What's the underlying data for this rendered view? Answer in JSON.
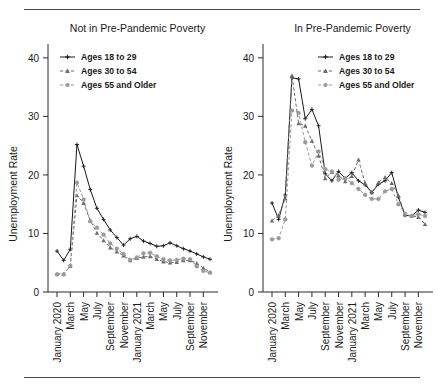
{
  "figure": {
    "top_rule": true,
    "bottom_rule": true,
    "rule_color": "#4a4a4a",
    "background": "#ffffff"
  },
  "axis": {
    "ylabel": "Unemployment Rate",
    "yticks": [
      0,
      10,
      20,
      30,
      40
    ],
    "ylim": [
      0,
      41
    ],
    "xtick_labels": [
      "January 2020",
      "March",
      "May",
      "July",
      "September",
      "November",
      "January 2021",
      "March",
      "May",
      "July",
      "September",
      "November"
    ],
    "xtick_indices": [
      0,
      2,
      4,
      6,
      8,
      10,
      12,
      14,
      16,
      18,
      20,
      22
    ]
  },
  "legend": {
    "entries": [
      {
        "label": "Ages 18 to 29",
        "color": "#1a1a1a",
        "marker": "cross",
        "dash": "solid"
      },
      {
        "label": "Ages 30 to 54",
        "color": "#6b6b6b",
        "marker": "triangle",
        "dash": "dashed"
      },
      {
        "label": "Ages 55 and Older",
        "color": "#9a9a9a",
        "marker": "circle",
        "dash": "dashed"
      }
    ]
  },
  "chart_data": [
    {
      "type": "line",
      "panel": "left",
      "title": "Not in Pre-Pandemic Poverty",
      "xlabel": "",
      "ylabel": "Unemployment Rate",
      "ylim": [
        0,
        41
      ],
      "grid": false,
      "legend_position": "top-left",
      "categories": [
        "January 2020",
        "February 2020",
        "March 2020",
        "April 2020",
        "May 2020",
        "June 2020",
        "July 2020",
        "August 2020",
        "September 2020",
        "October 2020",
        "November 2020",
        "December 2020",
        "January 2021",
        "February 2021",
        "March 2021",
        "April 2021",
        "May 2021",
        "June 2021",
        "July 2021",
        "August 2021",
        "September 2021",
        "October 2021",
        "November 2021",
        "December 2021"
      ],
      "series": [
        {
          "name": "Ages 18 to 29",
          "color": "#1a1a1a",
          "marker": "cross",
          "dash": "solid",
          "values": [
            7.0,
            5.4,
            7.3,
            25.2,
            21.5,
            17.5,
            14.3,
            12.4,
            10.6,
            9.3,
            8.0,
            9.1,
            9.5,
            8.7,
            8.3,
            7.8,
            7.9,
            8.4,
            7.9,
            7.4,
            7.0,
            6.5,
            6.0,
            5.6
          ],
          "linewidth": 1.0
        },
        {
          "name": "Ages 30 to 54",
          "color": "#6b6b6b",
          "marker": "triangle",
          "dash": "dashed",
          "values": [
            3.1,
            3.1,
            4.4,
            16.5,
            15.2,
            12.2,
            10.1,
            8.8,
            7.6,
            6.9,
            6.2,
            5.4,
            5.8,
            6.0,
            6.1,
            5.6,
            5.2,
            5.0,
            5.1,
            5.4,
            5.4,
            4.9,
            4.1,
            3.4
          ],
          "linewidth": 1.0
        },
        {
          "name": "Ages 55 and Older",
          "color": "#9a9a9a",
          "marker": "circle",
          "dash": "dashed",
          "values": [
            3.0,
            3.0,
            4.5,
            18.7,
            15.8,
            12.1,
            11.0,
            9.8,
            8.3,
            7.4,
            6.5,
            5.5,
            5.9,
            6.6,
            6.7,
            6.1,
            5.6,
            5.4,
            5.5,
            5.7,
            5.6,
            4.4,
            3.6,
            3.3
          ],
          "linewidth": 1.0
        }
      ]
    },
    {
      "type": "line",
      "panel": "right",
      "title": "In Pre-Pandemic Poverty",
      "xlabel": "",
      "ylabel": "Unemployment Rate",
      "ylim": [
        0,
        41
      ],
      "grid": false,
      "legend_position": "top-right",
      "categories": [
        "January 2020",
        "February 2020",
        "March 2020",
        "April 2020",
        "May 2020",
        "June 2020",
        "July 2020",
        "August 2020",
        "September 2020",
        "October 2020",
        "November 2020",
        "December 2020",
        "January 2021",
        "February 2021",
        "March 2021",
        "April 2021",
        "May 2021",
        "June 2021",
        "July 2021",
        "August 2021",
        "September 2021",
        "October 2021",
        "November 2021",
        "December 2021"
      ],
      "series": [
        {
          "name": "Ages 18 to 29",
          "color": "#1a1a1a",
          "marker": "cross",
          "dash": "solid",
          "values": [
            15.2,
            12.4,
            16.6,
            36.6,
            36.4,
            29.6,
            31.2,
            28.4,
            20.2,
            19.0,
            20.6,
            19.4,
            20.4,
            19.0,
            18.3,
            17.0,
            18.4,
            19.0,
            20.4,
            16.2,
            13.1,
            13.0,
            14.0,
            13.6
          ],
          "linewidth": 1.0
        },
        {
          "name": "Ages 30 to 54",
          "color": "#6b6b6b",
          "marker": "triangle",
          "dash": "dashed",
          "values": [
            12.2,
            13.1,
            16.0,
            37.0,
            28.8,
            28.4,
            25.8,
            23.3,
            19.4,
            20.5,
            19.9,
            18.9,
            19.8,
            22.6,
            18.6,
            17.0,
            18.7,
            19.6,
            18.6,
            16.5,
            13.2,
            13.0,
            12.8,
            11.6
          ],
          "linewidth": 1.0
        },
        {
          "name": "Ages 55 and Older",
          "color": "#9a9a9a",
          "marker": "circle",
          "dash": "dashed",
          "values": [
            9.0,
            9.2,
            12.4,
            31.0,
            30.6,
            25.6,
            21.6,
            24.0,
            21.0,
            20.6,
            19.2,
            19.4,
            18.6,
            17.6,
            16.6,
            15.9,
            15.9,
            17.2,
            17.6,
            15.0,
            13.4,
            13.0,
            13.3,
            13.0
          ],
          "linewidth": 1.0
        }
      ]
    }
  ]
}
